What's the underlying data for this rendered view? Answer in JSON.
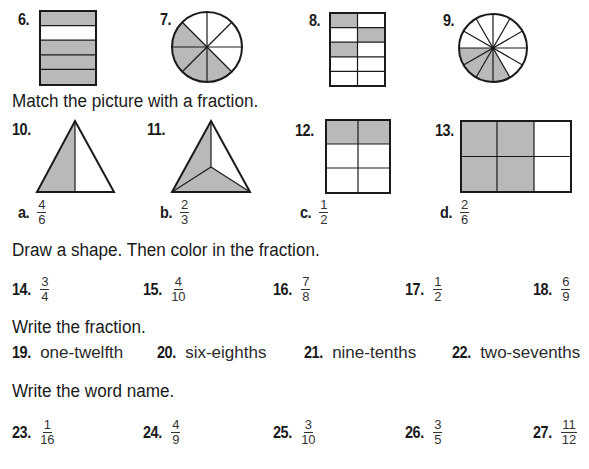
{
  "shading_color": "#b9b9b9",
  "identify_items": [
    {
      "number": "6.",
      "shape": "rectangle",
      "rows": 5,
      "cols": 1,
      "shaded": "4 of 5"
    },
    {
      "number": "7.",
      "shape": "circle",
      "sections": 8,
      "shaded": "4 of 8"
    },
    {
      "number": "8.",
      "shape": "rectangle",
      "rows": 5,
      "cols": 2,
      "shaded": "3 of 10"
    },
    {
      "number": "9.",
      "shape": "circle",
      "sections": 12,
      "shaded": "4 of 12"
    }
  ],
  "match_section": {
    "instruction": "Match the picture with a fraction.",
    "pictures": [
      {
        "number": "10.",
        "shape": "triangle-halves"
      },
      {
        "number": "11.",
        "shape": "triangle-thirds"
      },
      {
        "number": "12.",
        "shape": "grid-2x3"
      },
      {
        "number": "13.",
        "shape": "grid-3x2"
      }
    ],
    "choices": [
      {
        "letter": "a.",
        "numerator": "4",
        "denominator": "6"
      },
      {
        "letter": "b.",
        "numerator": "2",
        "denominator": "3"
      },
      {
        "letter": "c.",
        "numerator": "1",
        "denominator": "2"
      },
      {
        "letter": "d.",
        "numerator": "2",
        "denominator": "6"
      }
    ]
  },
  "draw_section": {
    "instruction": "Draw a shape. Then color in the fraction.",
    "items": [
      {
        "number": "14.",
        "numerator": "3",
        "denominator": "4"
      },
      {
        "number": "15.",
        "numerator": "4",
        "denominator": "10"
      },
      {
        "number": "16.",
        "numerator": "7",
        "denominator": "8"
      },
      {
        "number": "17.",
        "numerator": "1",
        "denominator": "2"
      },
      {
        "number": "18.",
        "numerator": "6",
        "denominator": "9"
      }
    ]
  },
  "write_fraction_section": {
    "instruction": "Write the fraction.",
    "items": [
      {
        "number": "19.",
        "text": "one-twelfth"
      },
      {
        "number": "20.",
        "text": "six-eighths"
      },
      {
        "number": "21.",
        "text": "nine-tenths"
      },
      {
        "number": "22.",
        "text": "two-sevenths"
      }
    ]
  },
  "word_name_section": {
    "instruction": "Write the word name.",
    "items": [
      {
        "number": "23.",
        "numerator": "1",
        "denominator": "16"
      },
      {
        "number": "24.",
        "numerator": "4",
        "denominator": "9"
      },
      {
        "number": "25.",
        "numerator": "3",
        "denominator": "10"
      },
      {
        "number": "26.",
        "numerator": "3",
        "denominator": "5"
      },
      {
        "number": "27.",
        "numerator": "11",
        "denominator": "12"
      }
    ]
  }
}
